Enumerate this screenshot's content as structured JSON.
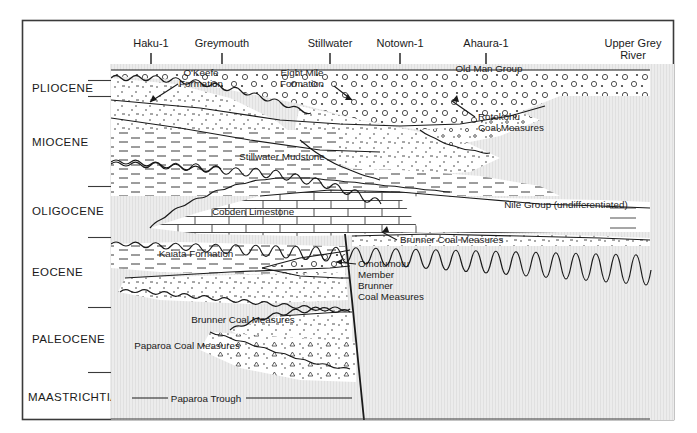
{
  "figure": {
    "kind": "geological-cross-section",
    "frame": {
      "x": 22,
      "y": 20,
      "width": 652,
      "height": 400
    },
    "colors": {
      "line": "#1a1a1a",
      "basement_fill": "#ececec",
      "unit_fill": "#ffffff",
      "text": "#1a1a1a",
      "hatch": "#c9c9c9"
    }
  },
  "epochs": [
    {
      "label": "PLIOCENE",
      "y": 88,
      "tick_top": 80,
      "tick_bottom": 96
    },
    {
      "label": "MIOCENE",
      "y": 142,
      "tick_top": 96,
      "tick_bottom": 186
    },
    {
      "label": "OLIGOCENE",
      "y": 211,
      "tick_top": 186,
      "tick_bottom": 237
    },
    {
      "label": "EOCENE",
      "y": 272,
      "tick_top": 237,
      "tick_bottom": 307
    },
    {
      "label": "PALEOCENE",
      "y": 339,
      "tick_top": 307,
      "tick_bottom": 372
    },
    {
      "label": "MAASTRICHTIAN",
      "y": 397,
      "tick_top": 372,
      "tick_bottom": 420
    }
  ],
  "wells": [
    {
      "label": "Haku-1",
      "x": 151,
      "line2": ""
    },
    {
      "label": "Greymouth",
      "x": 222,
      "line2": ""
    },
    {
      "label": "Stillwater",
      "x": 330,
      "line2": ""
    },
    {
      "label": "Notown-1",
      "x": 400,
      "line2": ""
    },
    {
      "label": "Ahaura-1",
      "x": 486,
      "line2": ""
    },
    {
      "label": "Upper Grey",
      "x": 633,
      "line2": "River"
    }
  ],
  "formations": [
    {
      "name": "O'Keefe Formation",
      "line1": "O'Keefe",
      "line2": "Formation",
      "x": 201,
      "y": 74,
      "leader": true
    },
    {
      "name": "Eight Mile Formation",
      "line1": "Eight Mile",
      "line2": "Formation",
      "x": 302,
      "y": 74,
      "leader": true
    },
    {
      "name": "Old Man Group",
      "line1": "Old Man Group",
      "line2": "",
      "x": 489,
      "y": 69,
      "leader": false
    },
    {
      "name": "Rotokohu Coal Measures",
      "line1": "Rotokohu",
      "line2": "Coal Measures",
      "x": 486,
      "y": 117,
      "leader": true
    },
    {
      "name": "Stillwater Mudstone",
      "line1": "Stillwater Mudstone",
      "line2": "",
      "x": 282,
      "y": 157,
      "leader": false
    },
    {
      "name": "Cobden Limestone",
      "line1": "Cobden Limestone",
      "line2": "",
      "x": 253,
      "y": 212,
      "leader": false
    },
    {
      "name": "Nile Group (undifferentiated)",
      "line1": "Nile Group (undifferentiated)",
      "line2": "",
      "x": 566,
      "y": 205,
      "leader": false
    },
    {
      "name": "Brunner Coal Measures (right)",
      "line1": "Brunner Coal Measures",
      "line2": "",
      "x": 460,
      "y": 240,
      "leader": true
    },
    {
      "name": "Kaiata Formation",
      "line1": "Kaiata Formation",
      "line2": "",
      "x": 196,
      "y": 254,
      "leader": false
    },
    {
      "name": "Omotumotu Member",
      "line1": "Omotumotu",
      "line2": "Member",
      "x": 390,
      "y": 264,
      "leader": true
    },
    {
      "name": "Brunner Coal Measures (inner)",
      "line1": "Brunner",
      "line2": "Coal Measures",
      "x": 359,
      "y": 286,
      "leader": false
    },
    {
      "name": "Brunner Coal Measures (lower)",
      "line1": "Brunner Coal Measures",
      "line2": "",
      "x": 243,
      "y": 320,
      "leader": false
    },
    {
      "name": "Paparoa Coal Measures",
      "line1": "Paparoa Coal Measures",
      "line2": "",
      "x": 187,
      "y": 346,
      "leader": false
    },
    {
      "name": "Paparoa Trough",
      "line1": "Paparoa Trough",
      "line2": "",
      "x": 206,
      "y": 399,
      "leader": false
    }
  ]
}
